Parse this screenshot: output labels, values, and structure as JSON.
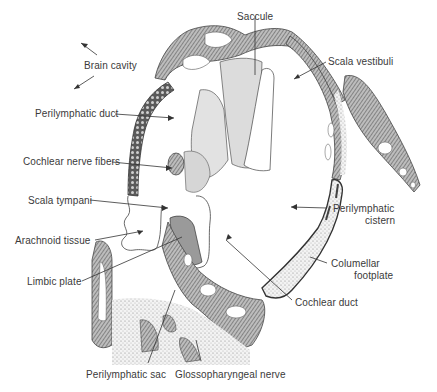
{
  "figure": {
    "type": "anatomical-diagram",
    "colors": {
      "background": "#ffffff",
      "ink": "#3a3a3a",
      "bone_fill": "#8a8a8a",
      "membrane_fill": "#d8d8d8",
      "stipple_fill": "#efefef",
      "duct_fill": "#6e6e6e"
    }
  },
  "labels": {
    "brain_cavity": "Brain cavity",
    "saccule": "Saccule",
    "scala_vestibuli": "Scala vestibuli",
    "perilymphatic_duct": "Perilymphatic  duct",
    "cochlear_nerve_fibers": "Cochlear nerve fibers",
    "scala_tympani": "Scala tympani",
    "perilymphatic_cistern_1": "Perilymphatic",
    "perilymphatic_cistern_2": "cistern",
    "arachnoid_tissue": "Arachnoid  tissue",
    "limbic_plate": "Limbic  plate",
    "columellar_footplate_1": "Columellar",
    "columellar_footplate_2": "footplate",
    "cochlear_duct": "Cochlear duct",
    "perilymphatic_sac": "Perilymphatic  sac",
    "glossopharyngeal_nerve": "Glossopharyngeal  nerve"
  }
}
